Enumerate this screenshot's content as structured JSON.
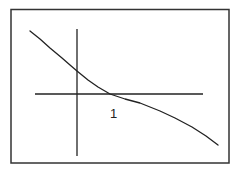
{
  "chart_data": {
    "type": "line",
    "title": "",
    "xlabel": "",
    "ylabel": "",
    "tick_labels": {
      "x": [
        "1"
      ]
    },
    "grid": false,
    "legend": null,
    "series": [
      {
        "name": "f(x)",
        "points_pixel": [
          [
            30,
            31
          ],
          [
            40,
            39
          ],
          [
            50,
            48
          ],
          [
            62,
            58
          ],
          [
            70,
            65
          ],
          [
            77,
            71
          ],
          [
            88,
            80
          ],
          [
            98,
            87
          ],
          [
            110,
            94
          ],
          [
            125,
            99
          ],
          [
            140,
            103
          ],
          [
            160,
            111
          ],
          [
            175,
            118
          ],
          [
            192,
            127
          ],
          [
            206,
            136
          ],
          [
            218,
            145
          ]
        ]
      }
    ],
    "x_intercept": 1,
    "colors": {
      "line": "#222222",
      "frame": "#333333",
      "background": "#ffffff"
    }
  },
  "labels": {
    "x_tick": "1"
  }
}
